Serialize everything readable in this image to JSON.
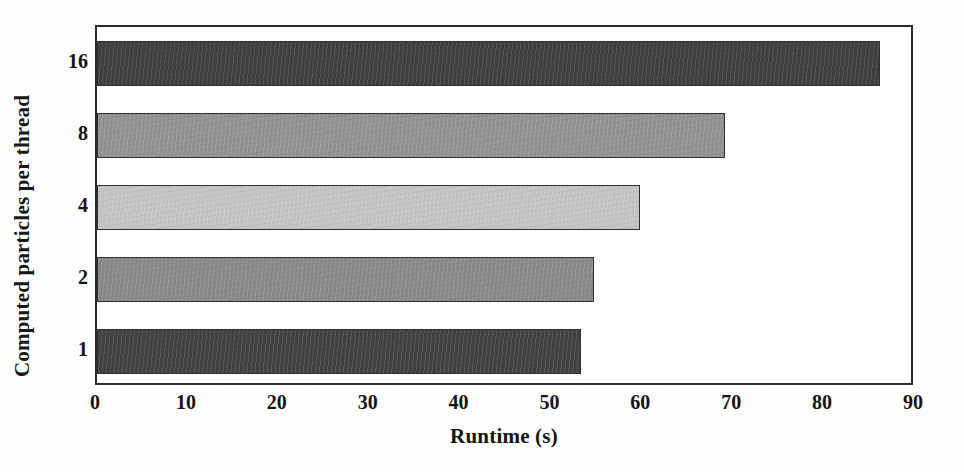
{
  "chart_data": {
    "type": "bar",
    "orientation": "horizontal",
    "title": "",
    "xlabel": "Runtime (s)",
    "ylabel": "Computed particles per thread",
    "categories": [
      "16",
      "8",
      "4",
      "2",
      "1"
    ],
    "values": [
      86.1,
      69.1,
      59.7,
      54.7,
      53.3
    ],
    "bar_colors": [
      "#3f3f3f",
      "#939393",
      "#c4c4c4",
      "#8a8a8a",
      "#424242"
    ],
    "xlim": [
      0,
      90
    ],
    "xticks": [
      0,
      10,
      20,
      30,
      40,
      50,
      60,
      70,
      80,
      90
    ],
    "xtick_labels": [
      "0",
      "10",
      "20",
      "30",
      "40",
      "50",
      "60",
      "70",
      "80",
      "90"
    ],
    "grid": false,
    "legend": "none",
    "axis_color": "#2b2b2b",
    "background": "#ffffff"
  }
}
